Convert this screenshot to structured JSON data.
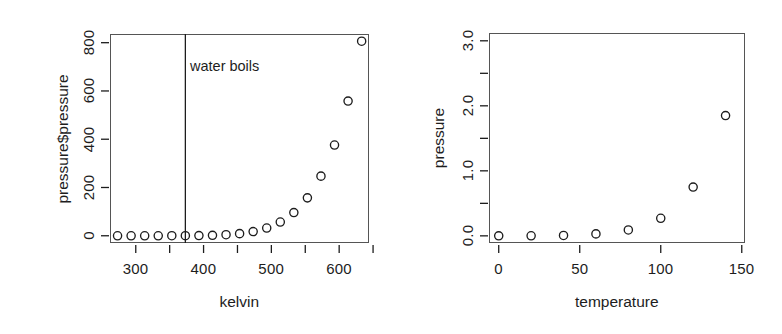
{
  "figure": {
    "background": "#ffffff",
    "ink_color": "#1d1d1d",
    "point_symbol": "open-circle"
  },
  "chart_data": [
    {
      "type": "scatter",
      "panel": "left",
      "title": "",
      "xlabel": "kelvin",
      "ylabel": "pressure$pressure",
      "xlim": [
        262,
        644
      ],
      "ylim": [
        -30,
        836
      ],
      "grid": false,
      "legend": null,
      "xticks": [
        300,
        400,
        500,
        600
      ],
      "xticks_minor": [
        350,
        450,
        550,
        650
      ],
      "yticks": [
        0,
        200,
        400,
        600,
        800
      ],
      "x": [
        273.15,
        293.15,
        313.15,
        333.15,
        353.15,
        373.15,
        393.15,
        413.15,
        433.15,
        453.15,
        473.15,
        493.15,
        513.15,
        533.15,
        553.15,
        573.15,
        593.15,
        613.15,
        633.15
      ],
      "y": [
        0.0002,
        0.0012,
        0.006,
        0.03,
        0.09,
        0.27,
        0.75,
        1.85,
        4.2,
        8.8,
        17.3,
        32.1,
        57.0,
        96.0,
        157.0,
        247.0,
        376.0,
        558.0,
        806.0
      ],
      "annotations": [
        {
          "name": "water-boils",
          "text": "water boils",
          "type": "vline-with-label",
          "x": 373.15,
          "label_x": 380,
          "label_y": 700
        }
      ]
    },
    {
      "type": "scatter",
      "panel": "right",
      "title": "",
      "xlabel": "temperature",
      "ylabel": "pressure",
      "xlim": [
        -6,
        152
      ],
      "ylim": [
        -0.11,
        3.12
      ],
      "grid": false,
      "legend": null,
      "xticks": [
        0,
        50,
        100,
        150
      ],
      "yticks": [
        0.0,
        1.0,
        2.0,
        3.0
      ],
      "yticks_minor": [
        0.5,
        1.5,
        2.5
      ],
      "x": [
        0,
        20,
        40,
        60,
        80,
        100,
        120,
        140
      ],
      "y": [
        0.0002,
        0.0012,
        0.006,
        0.03,
        0.09,
        0.27,
        0.75,
        1.85
      ]
    }
  ],
  "left_panel": {
    "x_title": "kelvin",
    "y_title": "pressure$pressure",
    "x_tick_labels": [
      "300",
      "400",
      "500",
      "600"
    ],
    "y_tick_labels": [
      "0",
      "200",
      "400",
      "600",
      "800"
    ],
    "annotation_text": "water boils"
  },
  "right_panel": {
    "x_title": "temperature",
    "y_title": "pressure",
    "x_tick_labels": [
      "0",
      "50",
      "100",
      "150"
    ],
    "y_tick_labels": [
      "0.0",
      "1.0",
      "2.0",
      "3.0"
    ]
  }
}
